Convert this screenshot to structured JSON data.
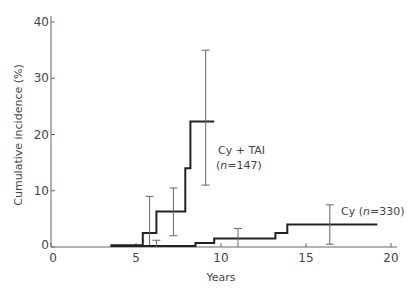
{
  "chart_data": {
    "type": "line",
    "subtype": "step",
    "title": "",
    "xlabel": "Years",
    "ylabel": "Cumulative incidence (%)",
    "xlim": [
      0,
      20
    ],
    "ylim": [
      0,
      40
    ],
    "xticks": [
      0,
      5,
      10,
      15,
      20
    ],
    "yticks": [
      0,
      10,
      20,
      30,
      40
    ],
    "grid": false,
    "legend": "inline labels",
    "series": [
      {
        "name": "Cy + TAI",
        "label_line1": "Cy + TAI",
        "label_line2": "(n=147)",
        "steps": [
          [
            3.5,
            0.3
          ],
          [
            5.4,
            2.5
          ],
          [
            6.2,
            6.3
          ],
          [
            7.9,
            14.0
          ],
          [
            8.2,
            22.3
          ],
          [
            9.6,
            22.3
          ]
        ],
        "error_bars": [
          {
            "x": 5.8,
            "low": 0.0,
            "high": 9.0
          },
          {
            "x": 7.2,
            "low": 2.0,
            "high": 10.5
          },
          {
            "x": 9.1,
            "low": 11.0,
            "high": 35.0
          }
        ]
      },
      {
        "name": "Cy",
        "label": "Cy (n=330)",
        "steps": [
          [
            3.5,
            0.2
          ],
          [
            8.5,
            0.7
          ],
          [
            9.6,
            1.5
          ],
          [
            13.2,
            2.5
          ],
          [
            13.9,
            4.0
          ],
          [
            19.2,
            4.0
          ]
        ],
        "error_bars": [
          {
            "x": 6.2,
            "low": 0.0,
            "high": 1.2
          },
          {
            "x": 11.0,
            "low": 0.0,
            "high": 3.3
          },
          {
            "x": 16.4,
            "low": 0.5,
            "high": 7.5
          }
        ]
      }
    ]
  }
}
